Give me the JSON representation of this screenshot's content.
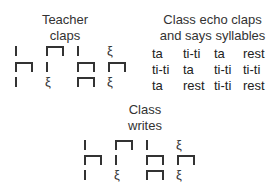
{
  "teacher": {
    "title_line1": "Teacher",
    "title_line2": "claps",
    "rows": [
      [
        "ta",
        "ti-ti",
        "ta",
        "rest"
      ],
      [
        "ti-ti",
        "ta",
        "ti-ti",
        "ti-ti"
      ],
      [
        "ta",
        "rest",
        "ti-ti",
        "rest"
      ]
    ]
  },
  "echo": {
    "title_line1": "Class echo claps",
    "title_line2": "and says syllables",
    "rows": [
      [
        "ta",
        "ti-ti",
        "ta",
        "rest"
      ],
      [
        "ti-ti",
        "ta",
        "ti-ti",
        "ti-ti"
      ],
      [
        "ta",
        "rest",
        "ti-ti",
        "rest"
      ]
    ]
  },
  "writes": {
    "title_line1": "Class",
    "title_line2": "writes",
    "rows": [
      [
        "ta",
        "ti-ti",
        "ta",
        "rest"
      ],
      [
        "ti-ti",
        "ta",
        "ti-ti",
        "ti-ti"
      ],
      [
        "ta",
        "rest",
        "ti-ti",
        "rest"
      ]
    ]
  },
  "icons": {
    "ta": "quarter-note-stem",
    "ti-ti": "eighth-note-pair-bracket",
    "rest": "quarter-rest"
  },
  "rest_glyph": "𝄽"
}
